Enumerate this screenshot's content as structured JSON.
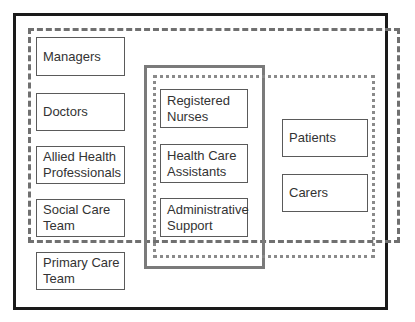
{
  "diagram": {
    "type": "nested-boundary-diagram",
    "boundaries": [
      {
        "id": "outer",
        "style": "solid-black"
      },
      {
        "id": "dashed",
        "style": "dashed-gray"
      },
      {
        "id": "solid-gray",
        "style": "solid-gray"
      },
      {
        "id": "dotted",
        "style": "dotted-gray"
      }
    ],
    "left_column": [
      {
        "label": "Managers"
      },
      {
        "label": "Doctors"
      },
      {
        "label": "Allied Health\nProfessionals"
      },
      {
        "label": "Social Care\nTeam"
      },
      {
        "label": "Primary Care\nTeam"
      }
    ],
    "middle_column": [
      {
        "label": "Registered\nNurses"
      },
      {
        "label": "Health Care\nAssistants"
      },
      {
        "label": "Administrative\nSupport"
      }
    ],
    "right_column": [
      {
        "label": "Patients"
      },
      {
        "label": "Carers"
      }
    ],
    "colors": {
      "outer_border": "#1a1a1a",
      "dashed_border": "#707070",
      "solid_gray_border": "#7a7a7a",
      "dotted_border": "#8a8a8a",
      "node_border": "#5a5a5a",
      "text": "#333333"
    }
  }
}
